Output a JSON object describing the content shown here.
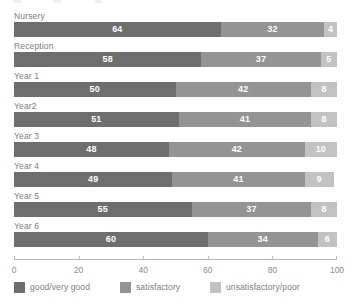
{
  "clipped_header": {
    "visible_fragments": [
      "",
      "",
      ""
    ]
  },
  "chart_data": {
    "type": "bar",
    "orientation": "horizontal",
    "stacked": true,
    "stacked_percent": true,
    "title": "",
    "xlabel": "",
    "ylabel": "",
    "xlim": [
      0,
      100
    ],
    "xticks": [
      0,
      20,
      40,
      60,
      80,
      100
    ],
    "xticklabels": [
      "0",
      "20",
      "40",
      "60",
      "80",
      "100"
    ],
    "grid": false,
    "legend_position": "bottom",
    "categories": [
      "Nursery",
      "Reception",
      "Year 1",
      "Year2",
      "Year 3",
      "Year 4",
      "Year 5",
      "Year 6"
    ],
    "series": [
      {
        "name": "good/very good",
        "color": "#6e6e6e",
        "values": [
          64,
          58,
          50,
          51,
          48,
          49,
          55,
          60
        ]
      },
      {
        "name": "satisfactory",
        "color": "#949494",
        "values": [
          32,
          37,
          42,
          41,
          42,
          41,
          37,
          34
        ]
      },
      {
        "name": "unsatisfactory/poor",
        "color": "#c2c2c2",
        "values": [
          4,
          5,
          8,
          8,
          10,
          9,
          8,
          6
        ]
      }
    ]
  },
  "legend": {
    "items": [
      {
        "label": "good/very good",
        "color": "#6e6e6e"
      },
      {
        "label": "satisfactory",
        "color": "#949494"
      },
      {
        "label": "unsatisfactory/poor",
        "color": "#c2c2c2"
      }
    ]
  },
  "axis": {
    "tick_labels": [
      "0",
      "20",
      "40",
      "60",
      "80",
      "100"
    ],
    "line_color": "#b9b9b9"
  },
  "colors": {
    "series_1": "#6e6e6e",
    "series_2": "#949494",
    "series_3": "#c2c2c2",
    "axis": "#b9b9b9",
    "label_text": "#7d7d7d",
    "value_text": "#ffffff",
    "background": "#ffffff"
  }
}
